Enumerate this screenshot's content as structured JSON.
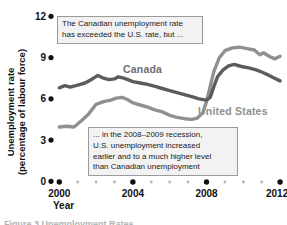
{
  "figure": {
    "y_axis_title_line1": "Unemployment rate",
    "y_axis_title_line2": "(percentage of labour force)",
    "x_axis_title": "Year",
    "caption_partial": "Figure 3 Unemployment Rates"
  },
  "annotations": {
    "box1": {
      "lines": [
        "The Canadian unemployment rate",
        "has exceeded the U.S. rate, but ..."
      ]
    },
    "box2": {
      "lines": [
        "... in the 2008–2009 recession,",
        "U.S. unemployment increased",
        "earlier and to a much higher level",
        "than Canadian unemployment"
      ]
    }
  },
  "colors": {
    "canada_line": "#5c5c5c",
    "us_line": "#909090",
    "major_dot": "#111111",
    "minor_dot": "#b3b3b3",
    "annotation_bg": "#f2f2f2",
    "annotation_border": "#9a9a9a"
  },
  "chart_data": {
    "type": "line",
    "title": "",
    "xlabel": "Year",
    "ylabel": "Unemployment rate (percentage of labour force)",
    "xlim": [
      2000,
      2012
    ],
    "ylim": [
      0,
      12
    ],
    "y_ticks": [
      0,
      3,
      6,
      9,
      12
    ],
    "x_ticks_major": [
      2000,
      2004,
      2008,
      2012
    ],
    "x_ticks_minor": [
      2001,
      2002,
      2003,
      2005,
      2006,
      2007,
      2009,
      2010,
      2011
    ],
    "grid": false,
    "legend_position": "inline-labels",
    "series": [
      {
        "name": "United States",
        "color": "#909090",
        "x": [
          2000.0,
          2000.4,
          2000.8,
          2001.2,
          2001.6,
          2002.0,
          2002.4,
          2002.8,
          2003.1,
          2003.4,
          2003.7,
          2004.0,
          2004.4,
          2004.8,
          2005.2,
          2005.6,
          2006.0,
          2006.4,
          2006.8,
          2007.2,
          2007.5,
          2007.8,
          2008.0,
          2008.2,
          2008.4,
          2008.7,
          2009.0,
          2009.4,
          2009.8,
          2010.2,
          2010.6,
          2010.9,
          2011.1,
          2011.4,
          2011.7,
          2012.0
        ],
        "values": [
          3.95,
          4.0,
          3.95,
          4.4,
          4.9,
          5.6,
          5.8,
          5.9,
          6.05,
          6.1,
          5.95,
          5.7,
          5.55,
          5.4,
          5.2,
          5.05,
          4.8,
          4.65,
          4.55,
          4.5,
          4.6,
          5.0,
          5.8,
          6.9,
          8.0,
          9.0,
          9.5,
          9.7,
          9.75,
          9.65,
          9.55,
          9.2,
          9.35,
          9.1,
          8.9,
          9.1
        ]
      },
      {
        "name": "Canada",
        "color": "#5c5c5c",
        "x": [
          2000.0,
          2000.3,
          2000.6,
          2001.0,
          2001.4,
          2001.8,
          2002.1,
          2002.4,
          2002.7,
          2003.0,
          2003.2,
          2003.5,
          2003.8,
          2004.0,
          2004.4,
          2004.8,
          2005.2,
          2005.6,
          2006.0,
          2006.4,
          2006.8,
          2007.2,
          2007.6,
          2008.0,
          2008.2,
          2008.4,
          2008.6,
          2008.9,
          2009.2,
          2009.5,
          2009.9,
          2010.3,
          2010.7,
          2011.0,
          2011.4,
          2011.7,
          2012.0
        ],
        "values": [
          6.8,
          6.95,
          6.85,
          7.0,
          7.15,
          7.45,
          7.7,
          7.5,
          7.4,
          7.45,
          7.6,
          7.5,
          7.35,
          7.25,
          7.15,
          7.05,
          6.9,
          6.75,
          6.6,
          6.45,
          6.3,
          6.15,
          6.0,
          5.9,
          6.1,
          6.9,
          7.6,
          8.1,
          8.4,
          8.5,
          8.35,
          8.25,
          8.1,
          7.95,
          7.7,
          7.5,
          7.3
        ]
      }
    ]
  }
}
